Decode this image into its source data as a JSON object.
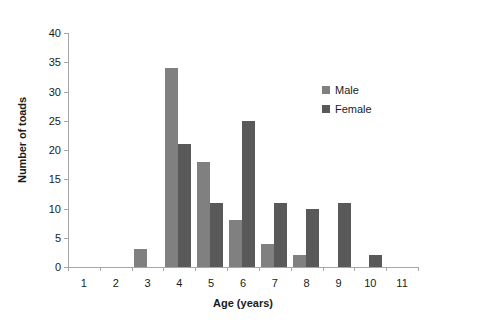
{
  "chart_data": {
    "type": "bar",
    "title": "",
    "xlabel": "Age (years)",
    "ylabel": "Number of toads",
    "categories": [
      "1",
      "2",
      "3",
      "4",
      "5",
      "6",
      "7",
      "8",
      "9",
      "10",
      "11"
    ],
    "series": [
      {
        "name": "Male",
        "color": "#808080",
        "values": [
          0,
          0,
          3,
          34,
          18,
          8,
          4,
          2,
          0,
          0,
          0
        ]
      },
      {
        "name": "Female",
        "color": "#595959",
        "values": [
          0,
          0,
          0,
          21,
          11,
          25,
          11,
          10,
          11,
          2,
          0
        ]
      }
    ],
    "ylim": [
      0,
      40
    ],
    "y_ticks": [
      "0",
      "5",
      "10",
      "15",
      "20",
      "25",
      "30",
      "35",
      "40"
    ],
    "y_tick_values": [
      0,
      5,
      10,
      15,
      20,
      25,
      30,
      35,
      40
    ],
    "grid": false,
    "legend_position": "inside-top-right",
    "axis_color": "#a6a6a6"
  }
}
